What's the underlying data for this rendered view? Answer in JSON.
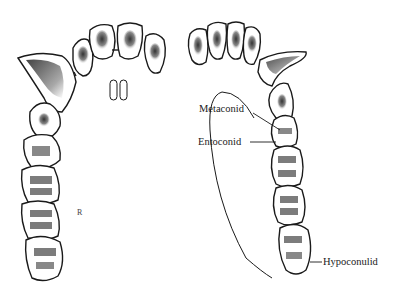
{
  "figure": {
    "labels": {
      "metaconid": "Metaconid",
      "entoconid": "Entoconid",
      "hypoconulid": "Hypoconulid"
    },
    "artist_mark": "R",
    "colors": {
      "ink": "#1a1a1a",
      "shade": "#555555",
      "background": "#ffffff"
    }
  }
}
